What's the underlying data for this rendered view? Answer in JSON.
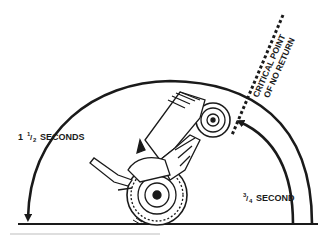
{
  "diagram": {
    "labels": {
      "long_time": {
        "whole": "1",
        "num": "1",
        "den": "2",
        "unit": "SECONDS"
      },
      "short_time": {
        "num": "3",
        "den": "4",
        "unit": "SECOND"
      },
      "critical_line1": "CRITICAL POINT",
      "critical_line2": "OF NO RETURN"
    },
    "colors": {
      "ink": "#1a1a1a",
      "background": "#ffffff",
      "rule": "#bdbdbd"
    }
  }
}
